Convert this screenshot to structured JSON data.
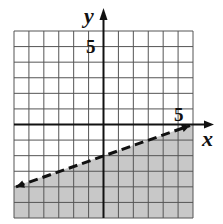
{
  "chart_data": {
    "type": "inequality-graph",
    "title": "",
    "xlabel": "x",
    "ylabel": "y",
    "xlim": [
      -6,
      6
    ],
    "ylim": [
      -6,
      6
    ],
    "grid": true,
    "tick_labels": {
      "x": "5",
      "y": "5"
    },
    "boundary_line": {
      "equation": "y = (1/3)x - 2",
      "slope": 0.3333,
      "intercept": -2,
      "style": "dashed",
      "points": [
        [
          -6,
          -4
        ],
        [
          6,
          0
        ]
      ]
    },
    "shaded_region": "below",
    "inequality": "y < (1/3)x - 2",
    "colors": {
      "shade": "#c8c8c8",
      "grid": "#555555",
      "axis": "#111111"
    }
  },
  "labels": {
    "x_axis": "x",
    "y_axis": "y",
    "x_tick": "5",
    "y_tick": "5"
  }
}
